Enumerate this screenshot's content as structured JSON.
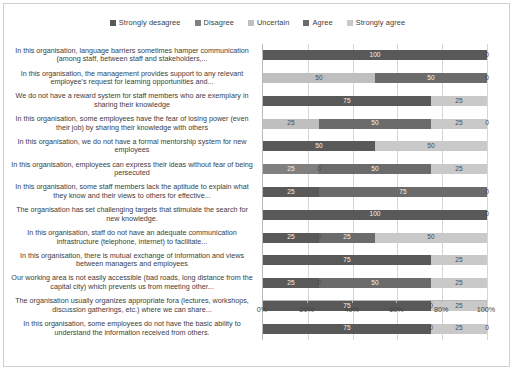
{
  "chart_data": {
    "type": "bar",
    "orientation": "horizontal",
    "stacked": true,
    "stack_mode": "percent",
    "title": "",
    "xlabel": "",
    "ylabel": "",
    "xlim": [
      0,
      100
    ],
    "xticks": [
      "0%",
      "20%",
      "40%",
      "60%",
      "80%",
      "100%"
    ],
    "grid": true,
    "legend_position": "top",
    "series": [
      {
        "name": "Strongly desagree",
        "color": "#595959",
        "values": [
          100,
          0,
          75,
          0,
          50,
          0,
          25,
          100,
          25,
          75,
          25,
          75,
          75
        ]
      },
      {
        "name": "Disagree",
        "color": "#808080",
        "values": [
          0,
          0,
          0,
          0,
          0,
          25,
          0,
          0,
          0,
          0,
          0,
          0,
          0
        ]
      },
      {
        "name": "Uncertain",
        "color": "#bfbfbf",
        "values": [
          0,
          50,
          0,
          25,
          0,
          0,
          0,
          0,
          0,
          0,
          0,
          0,
          0
        ]
      },
      {
        "name": "Agree",
        "color": "#6b6b6b",
        "values": [
          0,
          50,
          0,
          50,
          0,
          50,
          75,
          0,
          25,
          0,
          50,
          0,
          0
        ]
      },
      {
        "name": "Strongly agree",
        "color": "#c9c9c9",
        "values": [
          0,
          0,
          25,
          25,
          50,
          25,
          0,
          0,
          50,
          25,
          25,
          25,
          25
        ]
      }
    ],
    "categories": [
      "In this organisation, language barriers sometimes hamper communication (among staff, between staff and stakeholders,...",
      "In this organisation, the management provides support to any relevant employee's request for learning opportunities and...",
      "We do not have a reward system for staff members who are exemplary in sharing their knowledge",
      "In this organisation, some employees have the fear of losing power (even their job) by sharing their knowledge with others",
      "In this organisation, we do not have a formal mentorship system for new employees",
      "In this organisation, employees can express their ideas without fear of being persecuted",
      "In this organisation, some staff members lack the aptitude to explain what they know and their views to others for effective...",
      "The organisation has set challenging targets that stimulate the search for new knowledge.",
      "In this organisation, staff do not have an adequate communication infrastructure (telephone, internet) to facilitate...",
      "In this organisation, there is mutual exchange of information and views between managers and employees",
      "Our working area is not easily accessible (bad roads, long distance from the capital city) which prevents us from meeting other...",
      "The organisation usually organizes appropriate fora (lectures, workshops, discussion gatherings, etc.) where we can share...",
      "In this organisation, some employees do not have the basic ability to understand the information received from others."
    ],
    "rows": [
      {
        "segments": [
          {
            "series": "Strongly desagree",
            "value": 100,
            "label": "100",
            "show": true
          },
          {
            "series": "Agree",
            "value": 0,
            "label": "0",
            "show": true
          }
        ]
      },
      {
        "segments": [
          {
            "series": "Uncertain",
            "value": 50,
            "label": "50",
            "show": true
          },
          {
            "series": "Agree",
            "value": 50,
            "label": "50",
            "show": true
          },
          {
            "series": "Strongly agree",
            "value": 0,
            "label": "0",
            "show": true
          }
        ]
      },
      {
        "segments": [
          {
            "series": "Strongly desagree",
            "value": 75,
            "label": "75",
            "show": true
          },
          {
            "series": "Strongly agree",
            "value": 25,
            "label": "25",
            "show": true
          }
        ]
      },
      {
        "segments": [
          {
            "series": "Uncertain",
            "value": 25,
            "label": "25",
            "show": true
          },
          {
            "series": "Agree",
            "value": 50,
            "label": "50",
            "show": true
          },
          {
            "series": "Strongly agree",
            "value": 25,
            "label": "25",
            "show": true
          },
          {
            "series": "Strongly agree",
            "value": 0,
            "label": "0",
            "show": true
          }
        ]
      },
      {
        "segments": [
          {
            "series": "Strongly desagree",
            "value": 50,
            "label": "50",
            "show": true
          },
          {
            "series": "Strongly agree",
            "value": 50,
            "label": "50",
            "show": true
          }
        ]
      },
      {
        "segments": [
          {
            "series": "Disagree",
            "value": 25,
            "label": "25",
            "show": true
          },
          {
            "series": "Disagree",
            "value": 0,
            "label": "0",
            "show": true
          },
          {
            "series": "Agree",
            "value": 50,
            "label": "50",
            "show": true
          },
          {
            "series": "Strongly agree",
            "value": 25,
            "label": "25",
            "show": true
          }
        ]
      },
      {
        "segments": [
          {
            "series": "Strongly desagree",
            "value": 25,
            "label": "25",
            "show": true
          },
          {
            "series": "Agree",
            "value": 75,
            "label": "75",
            "show": true
          },
          {
            "series": "Strongly agree",
            "value": 0,
            "label": "0",
            "show": true
          }
        ]
      },
      {
        "segments": [
          {
            "series": "Strongly desagree",
            "value": 100,
            "label": "100",
            "show": true
          },
          {
            "series": "Strongly agree",
            "value": 0,
            "label": "0",
            "show": true
          }
        ]
      },
      {
        "segments": [
          {
            "series": "Strongly desagree",
            "value": 25,
            "label": "25",
            "show": true
          },
          {
            "series": "Disagree",
            "value": 0,
            "label": "0",
            "show": true
          },
          {
            "series": "Agree",
            "value": 25,
            "label": "25",
            "show": true
          },
          {
            "series": "Strongly agree",
            "value": 50,
            "label": "50",
            "show": true
          }
        ]
      },
      {
        "segments": [
          {
            "series": "Strongly desagree",
            "value": 75,
            "label": "75",
            "show": true
          },
          {
            "series": "Strongly agree",
            "value": 25,
            "label": "25",
            "show": true
          }
        ]
      },
      {
        "segments": [
          {
            "series": "Strongly desagree",
            "value": 25,
            "label": "25",
            "show": true
          },
          {
            "series": "Disagree",
            "value": 0,
            "label": "0",
            "show": true
          },
          {
            "series": "Agree",
            "value": 50,
            "label": "50",
            "show": true
          },
          {
            "series": "Strongly agree",
            "value": 25,
            "label": "25",
            "show": true
          }
        ]
      },
      {
        "segments": [
          {
            "series": "Strongly desagree",
            "value": 75,
            "label": "75",
            "show": true
          },
          {
            "series": "Agree",
            "value": 0,
            "label": "0",
            "show": true
          },
          {
            "series": "Strongly agree",
            "value": 25,
            "label": "25",
            "show": true
          }
        ]
      },
      {
        "segments": [
          {
            "series": "Strongly desagree",
            "value": 75,
            "label": "75",
            "show": true
          },
          {
            "series": "Agree",
            "value": 0,
            "label": "0",
            "show": true
          },
          {
            "series": "Strongly agree",
            "value": 25,
            "label": "25",
            "show": true
          },
          {
            "series": "Strongly agree",
            "value": 0,
            "label": "0",
            "show": true
          }
        ]
      }
    ]
  },
  "colors": {
    "strongly_desagree": "#595959",
    "disagree": "#808080",
    "uncertain": "#bfbfbf",
    "agree": "#6b6b6b",
    "strongly_agree": "#c9c9c9",
    "grid": "#d6d6d6",
    "axis": "#b9b9b9",
    "border": "#cfcfcf"
  }
}
